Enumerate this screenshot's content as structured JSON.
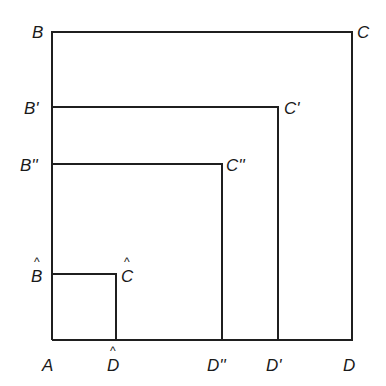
{
  "diagram": {
    "stroke_color": "#1f1f1f",
    "labels": {
      "A": "A",
      "B": "B",
      "C": "C",
      "D": "D",
      "B1": "B'",
      "C1": "C'",
      "D1": "D'",
      "B2": "B''",
      "C2": "C''",
      "D2": "D''",
      "Bh": "B",
      "Ch": "C",
      "Dh": "D"
    },
    "hat_labels": [
      "Bh",
      "Ch",
      "Dh"
    ],
    "shapes": [
      {
        "name": "ABCD",
        "top_y": 32,
        "right_x": 352
      },
      {
        "name": "AB'C'D'",
        "top_y": 107,
        "right_x": 278
      },
      {
        "name": "AB''C''D''",
        "top_y": 164,
        "right_x": 222
      },
      {
        "name": "AB^C^D^",
        "top_y": 274,
        "right_x": 116
      }
    ],
    "origin": {
      "x": 52,
      "y": 340
    }
  }
}
